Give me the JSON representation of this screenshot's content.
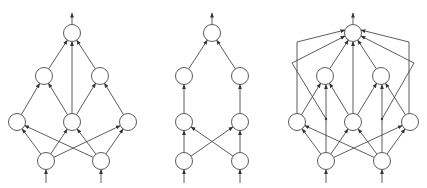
{
  "diagram": {
    "width": 427,
    "height": 188,
    "colors": {
      "stroke": "#4a4a4a",
      "fill": "#ffffff",
      "arrow": "#333333"
    },
    "node_radius": 8.5,
    "graphs": [
      {
        "id": "graph-1",
        "nodes": {
          "top": [
            72,
            33
          ],
          "l2a": [
            44,
            76
          ],
          "l2b": [
            100,
            76
          ],
          "l3a": [
            17,
            122
          ],
          "l3b": [
            72,
            122
          ],
          "l3c": [
            128,
            122
          ],
          "l4a": [
            46,
            161
          ],
          "l4b": [
            101,
            161
          ]
        },
        "edges": [
          [
            "l2a",
            "top"
          ],
          [
            "l2b",
            "top"
          ],
          [
            "l3b",
            "top"
          ],
          [
            "l3a",
            "l2a"
          ],
          [
            "l3b",
            "l2a"
          ],
          [
            "l3b",
            "l2b"
          ],
          [
            "l3c",
            "l2b"
          ],
          [
            "l4a",
            "l3a"
          ],
          [
            "l4a",
            "l3b"
          ],
          [
            "l4a",
            "l3c"
          ],
          [
            "l4b",
            "l3a"
          ],
          [
            "l4b",
            "l3b"
          ],
          [
            "l4b",
            "l3c"
          ]
        ],
        "polylines": [],
        "inputs": [
          "l4a",
          "l4b"
        ],
        "output": "top"
      },
      {
        "id": "graph-2",
        "nodes": {
          "top": [
            212,
            33
          ],
          "l2a": [
            184,
            76
          ],
          "l2b": [
            240,
            76
          ],
          "l3a": [
            184,
            122
          ],
          "l3b": [
            240,
            122
          ],
          "l4a": [
            184,
            161
          ],
          "l4b": [
            240,
            161
          ]
        },
        "edges": [
          [
            "l2a",
            "top"
          ],
          [
            "l2b",
            "top"
          ],
          [
            "l3a",
            "l2a"
          ],
          [
            "l3b",
            "l2b"
          ],
          [
            "l4a",
            "l3a"
          ],
          [
            "l4a",
            "l3b"
          ],
          [
            "l4b",
            "l3a"
          ],
          [
            "l4b",
            "l3b"
          ]
        ],
        "polylines": [],
        "inputs": [
          "l4a",
          "l4b"
        ],
        "output": "top"
      },
      {
        "id": "graph-3",
        "nodes": {
          "top": [
            353,
            33
          ],
          "l2a": [
            325,
            76
          ],
          "l2b": [
            381,
            76
          ],
          "l3a": [
            297,
            122
          ],
          "l3b": [
            353,
            122
          ],
          "l3c": [
            410,
            122
          ],
          "l4a": [
            326,
            161
          ],
          "l4b": [
            382,
            161
          ]
        },
        "edges": [
          [
            "l2a",
            "top"
          ],
          [
            "l2b",
            "top"
          ],
          [
            "l3b",
            "top"
          ],
          [
            "l3a",
            "l2a"
          ],
          [
            "l3b",
            "l2a"
          ],
          [
            "l3b",
            "l2b"
          ],
          [
            "l3c",
            "l2b"
          ],
          [
            "l4a",
            "l3a"
          ],
          [
            "l4a",
            "l3b"
          ],
          [
            "l4a",
            "l3c"
          ],
          [
            "l4b",
            "l3a"
          ],
          [
            "l4b",
            "l3b"
          ],
          [
            "l4b",
            "l3c"
          ]
        ],
        "polylines": [
          {
            "points": [
              [
                297,
                113.5
              ],
              [
                297,
                42
              ],
              [
                345,
                30
              ]
            ],
            "arrow": true
          },
          {
            "points": [
              [
                409,
                113.5
              ],
              [
                409,
                42
              ],
              [
                361,
                30
              ]
            ],
            "arrow": true
          },
          {
            "points": [
              [
                326,
                152.5
              ],
              [
                326,
                84.5
              ]
            ],
            "arrow": true
          },
          {
            "points": [
              [
                382,
                152.5
              ],
              [
                382,
                84.5
              ]
            ],
            "arrow": true
          },
          {
            "points": [
              [
                326,
                119
              ],
              [
                292,
                63
              ],
              [
                345,
                36
              ]
            ],
            "arrow": true
          },
          {
            "points": [
              [
                382,
                119
              ],
              [
                414,
                63
              ],
              [
                361,
                36
              ]
            ],
            "arrow": true
          }
        ],
        "junctions": [
          [
            326,
            119
          ],
          [
            382,
            119
          ]
        ],
        "inputs": [
          "l4a",
          "l4b"
        ],
        "output": "top"
      }
    ]
  }
}
